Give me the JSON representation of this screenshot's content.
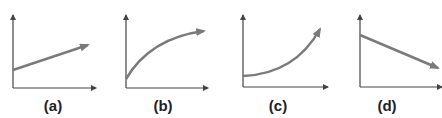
{
  "figure": {
    "panels": [
      {
        "label": "(a)",
        "shape": "linear-increasing",
        "label_x": 53
      },
      {
        "label": "(b)",
        "shape": "concave-increasing",
        "label_x": 163
      },
      {
        "label": "(c)",
        "shape": "convex-increasing",
        "label_x": 278
      },
      {
        "label": "(d)",
        "shape": "linear-decreasing",
        "label_x": 387
      }
    ],
    "colors": {
      "axis": "#444444",
      "curve": "#7a7a7a"
    }
  }
}
